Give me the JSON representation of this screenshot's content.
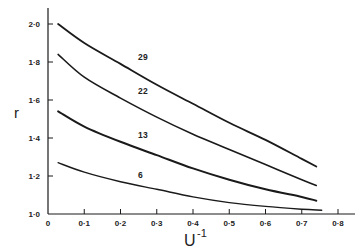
{
  "chart_data": {
    "type": "line",
    "title": "",
    "xlabel": "U",
    "xlabel_superscript": "-1",
    "ylabel": "r",
    "xlim": [
      0,
      0.8
    ],
    "ylim": [
      1.0,
      2.0
    ],
    "grid": false,
    "legend": "none (curves labelled inline)",
    "x_ticks": [
      "0",
      "0·1",
      "0·2",
      "0·3",
      "0·4",
      "0·5",
      "0·6",
      "0·7",
      "0·8"
    ],
    "y_ticks": [
      "1·0",
      "1·2",
      "1·4",
      "1·6",
      "1·8",
      "2·0"
    ],
    "series": [
      {
        "name": "29",
        "label_x": 0.27,
        "label_y": 1.79,
        "x": [
          0.028,
          0.1,
          0.2,
          0.3,
          0.4,
          0.5,
          0.6,
          0.7,
          0.74
        ],
        "y": [
          2.0,
          1.9,
          1.79,
          1.68,
          1.58,
          1.48,
          1.39,
          1.29,
          1.25
        ]
      },
      {
        "name": "22",
        "label_x": 0.27,
        "label_y": 1.61,
        "x": [
          0.028,
          0.1,
          0.2,
          0.3,
          0.4,
          0.5,
          0.6,
          0.7,
          0.74
        ],
        "y": [
          1.84,
          1.72,
          1.61,
          1.51,
          1.42,
          1.34,
          1.26,
          1.18,
          1.15
        ]
      },
      {
        "name": "13",
        "label_x": 0.27,
        "label_y": 1.38,
        "x": [
          0.028,
          0.1,
          0.2,
          0.3,
          0.4,
          0.5,
          0.6,
          0.7,
          0.74
        ],
        "y": [
          1.54,
          1.46,
          1.38,
          1.31,
          1.24,
          1.18,
          1.13,
          1.09,
          1.07
        ]
      },
      {
        "name": "6",
        "label_x": 0.27,
        "label_y": 1.17,
        "x": [
          0.028,
          0.1,
          0.2,
          0.3,
          0.4,
          0.5,
          0.6,
          0.7,
          0.755
        ],
        "y": [
          1.27,
          1.22,
          1.17,
          1.13,
          1.09,
          1.06,
          1.04,
          1.025,
          1.02
        ]
      }
    ]
  },
  "colors": {
    "line": "#1a1a1a",
    "background": "#ffffff"
  }
}
